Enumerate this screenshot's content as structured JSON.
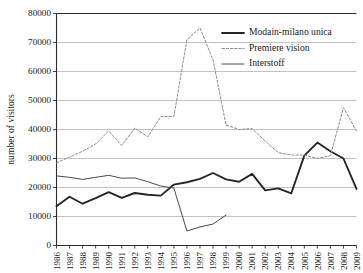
{
  "chart_data": {
    "type": "line",
    "title": "",
    "xlabel": "",
    "ylabel": "number of visitors",
    "ylim": [
      0,
      80000
    ],
    "ytick_step": 10000,
    "yticks": [
      0,
      10000,
      20000,
      30000,
      40000,
      50000,
      60000,
      70000,
      80000
    ],
    "grid": true,
    "legend_position": "top-right",
    "categories": [
      "1986",
      "1987",
      "1988",
      "1989",
      "1990",
      "1991",
      "1992",
      "1993",
      "1994",
      "1995",
      "1996",
      "1997",
      "1998",
      "1999",
      "2000",
      "2001",
      "2002",
      "2003",
      "2004",
      "2005",
      "2006",
      "2007",
      "2008",
      "2009"
    ],
    "series": [
      {
        "name": "Modain-milano unica",
        "style": "solid-thick",
        "color": "#262626",
        "values": [
          13500,
          16800,
          14400,
          16300,
          18400,
          16400,
          18100,
          17500,
          17200,
          21000,
          21800,
          23000,
          25000,
          22800,
          22000,
          24700,
          19000,
          19700,
          18000,
          31000,
          35500,
          32500,
          30000,
          19500
        ]
      },
      {
        "name": "Premiere vision",
        "style": "dashed",
        "color": "#8c8c8c",
        "values": [
          28500,
          30500,
          32500,
          35000,
          39500,
          34500,
          40500,
          37500,
          44500,
          44500,
          71000,
          75000,
          64000,
          41500,
          40000,
          40300,
          36000,
          32000,
          31200,
          31200,
          30000,
          31000,
          47500,
          39500
        ]
      },
      {
        "name": "Interstoff",
        "style": "solid-thin",
        "color": "#4a4a4a",
        "values": [
          24000,
          23500,
          22800,
          23500,
          24200,
          23200,
          23300,
          22000,
          20500,
          19800,
          5000,
          6400,
          7400,
          10500,
          null,
          null,
          null,
          null,
          null,
          null,
          null,
          null,
          null,
          null
        ]
      }
    ]
  },
  "legend": {
    "entries": [
      {
        "label": "Modain-milano unica"
      },
      {
        "label": "Premiere vision"
      },
      {
        "label": "Interstoff"
      }
    ]
  }
}
